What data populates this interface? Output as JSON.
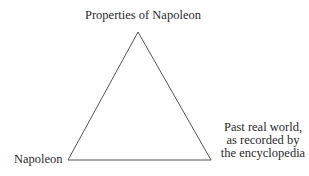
{
  "diagram": {
    "type": "semiotic-triangle",
    "nodes": {
      "top": {
        "label": "Properties of Napoleon"
      },
      "bottom_left": {
        "label": "Napoleon"
      },
      "bottom_right": {
        "lines": [
          "Past real world,",
          "as recorded by",
          "the encyclopedia"
        ]
      }
    },
    "edges": [
      {
        "from": "top",
        "to": "bottom_left",
        "style": "solid"
      },
      {
        "from": "top",
        "to": "bottom_right",
        "style": "solid"
      },
      {
        "from": "bottom_left",
        "to": "bottom_right",
        "style": "solid"
      }
    ],
    "colors": {
      "line": "#555555",
      "text": "#2a2a2a",
      "background": "#ffffff"
    }
  }
}
